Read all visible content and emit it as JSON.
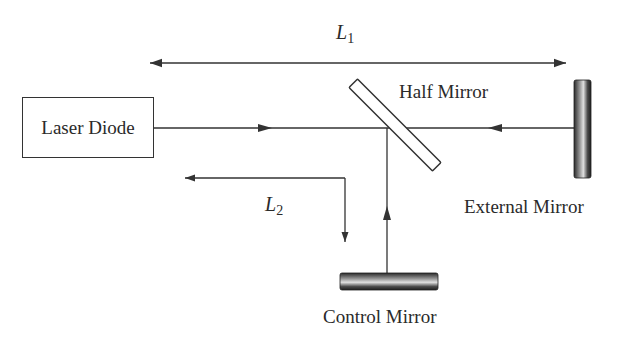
{
  "diagram": {
    "type": "optical-setup",
    "components": {
      "laser_diode": {
        "label": "Laser Diode"
      },
      "half_mirror": {
        "label": "Half Mirror"
      },
      "external_mirror": {
        "label": "External Mirror"
      },
      "control_mirror": {
        "label": "Control Mirror"
      }
    },
    "distances": {
      "L1": {
        "symbol": "L",
        "subscript": "1"
      },
      "L2": {
        "symbol": "L",
        "subscript": "2"
      }
    },
    "colors": {
      "line": "#333333",
      "mirror_dark": "#2a2a2a",
      "mirror_light": "#d8d8d8"
    }
  }
}
